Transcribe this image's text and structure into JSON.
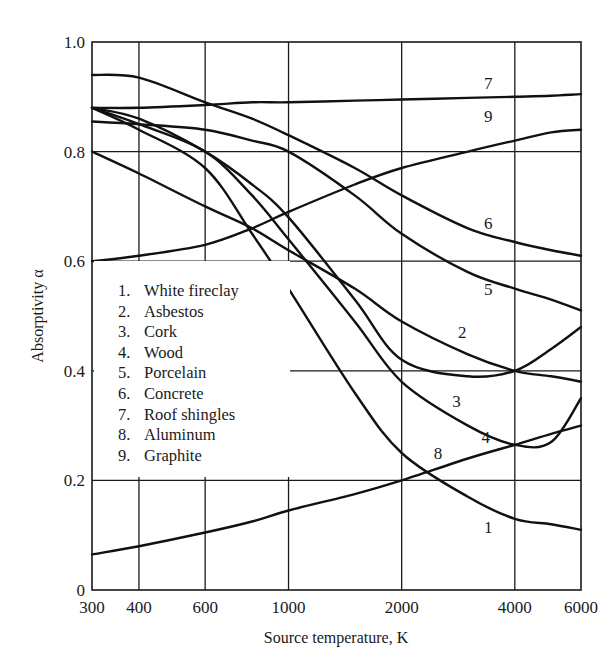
{
  "chart_data": {
    "type": "line",
    "title": "",
    "xlabel": "Source temperature, K",
    "ylabel": "Absorptivity α",
    "xscale": "log",
    "xlim": [
      300,
      6000
    ],
    "ylim": [
      0,
      1.0
    ],
    "grid": true,
    "x_ticks": [
      300,
      400,
      600,
      1000,
      2000,
      4000,
      6000
    ],
    "x_tick_labels": [
      "300",
      "400",
      "600",
      "1000",
      "2000",
      "4000",
      "6000"
    ],
    "y_ticks": [
      0,
      0.2,
      0.4,
      0.6,
      0.8,
      1.0
    ],
    "y_tick_labels": [
      "0",
      "0.2",
      "0.4",
      "0.6",
      "0.8",
      "1.0"
    ],
    "legend_position": "inside-left",
    "x": [
      300,
      400,
      600,
      800,
      1000,
      1500,
      2000,
      3000,
      4000,
      5000,
      6000
    ],
    "series": [
      {
        "id": "1",
        "name": "White fireclay",
        "label_at": [
          3400,
          0.115
        ],
        "values": [
          0.88,
          0.84,
          0.77,
          0.65,
          0.55,
          0.36,
          0.25,
          0.17,
          0.13,
          0.12,
          0.11
        ]
      },
      {
        "id": "2",
        "name": "Asbestos",
        "label_at": [
          2900,
          0.47
        ],
        "values": [
          0.8,
          0.76,
          0.7,
          0.66,
          0.62,
          0.55,
          0.49,
          0.43,
          0.4,
          0.39,
          0.38
        ]
      },
      {
        "id": "3",
        "name": "Cork",
        "label_at": [
          2800,
          0.345
        ],
        "values": [
          0.88,
          0.86,
          0.8,
          0.74,
          0.68,
          0.53,
          0.42,
          0.39,
          0.4,
          0.44,
          0.48
        ]
      },
      {
        "id": "4",
        "name": "Wood",
        "label_at": [
          3350,
          0.28
        ],
        "values": [
          0.88,
          0.85,
          0.8,
          0.72,
          0.64,
          0.49,
          0.38,
          0.3,
          0.265,
          0.27,
          0.35
        ]
      },
      {
        "id": "5",
        "name": "Porcelain",
        "label_at": [
          3400,
          0.55
        ],
        "values": [
          0.855,
          0.85,
          0.84,
          0.82,
          0.8,
          0.72,
          0.65,
          0.58,
          0.55,
          0.53,
          0.51
        ]
      },
      {
        "id": "6",
        "name": "Concrete",
        "label_at": [
          3400,
          0.67
        ],
        "values": [
          0.94,
          0.935,
          0.89,
          0.86,
          0.83,
          0.77,
          0.72,
          0.66,
          0.635,
          0.62,
          0.61
        ]
      },
      {
        "id": "7",
        "name": "Roof shingles",
        "label_at": [
          3400,
          0.925
        ],
        "values": [
          0.88,
          0.88,
          0.885,
          0.89,
          0.89,
          0.893,
          0.895,
          0.898,
          0.9,
          0.902,
          0.905
        ]
      },
      {
        "id": "8",
        "name": "Aluminum",
        "label_at": [
          2500,
          0.25
        ],
        "values": [
          0.065,
          0.08,
          0.105,
          0.125,
          0.145,
          0.175,
          0.2,
          0.24,
          0.265,
          0.285,
          0.3
        ]
      },
      {
        "id": "9",
        "name": "Graphite",
        "label_at": [
          3400,
          0.865
        ],
        "values": [
          0.6,
          0.61,
          0.63,
          0.66,
          0.69,
          0.74,
          0.77,
          0.8,
          0.82,
          0.835,
          0.84
        ]
      }
    ]
  },
  "axes": {
    "x_title": "Source temperature, K",
    "y_title": "Absorptivity α"
  },
  "legend": {
    "items": [
      {
        "num": "1.",
        "label": "White fireclay"
      },
      {
        "num": "2.",
        "label": "Asbestos"
      },
      {
        "num": "3.",
        "label": "Cork"
      },
      {
        "num": "4.",
        "label": "Wood"
      },
      {
        "num": "5.",
        "label": "Porcelain"
      },
      {
        "num": "6.",
        "label": "Concrete"
      },
      {
        "num": "7.",
        "label": "Roof shingles"
      },
      {
        "num": "8.",
        "label": "Aluminum"
      },
      {
        "num": "9.",
        "label": "Graphite"
      }
    ]
  }
}
